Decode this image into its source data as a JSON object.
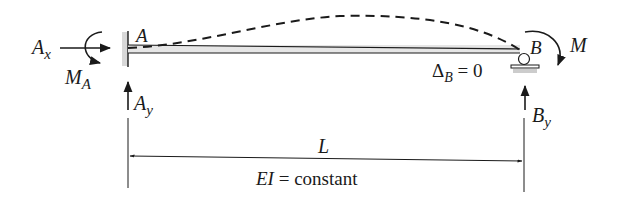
{
  "diagram": {
    "type": "beam-free-body",
    "labels": {
      "point_a": "A",
      "point_b": "B",
      "ax": "A",
      "ax_sub": "x",
      "ma": "M",
      "ma_sub": "A",
      "ay": "A",
      "ay_sub": "y",
      "by": "B",
      "by_sub": "y",
      "moment_b": "M",
      "delta_b": "Δ",
      "delta_b_sub": "B",
      "delta_b_value": " = 0",
      "length": "L",
      "ei": "EI",
      "ei_value": " = constant"
    },
    "supports": {
      "left": "fixed",
      "right": "roller"
    },
    "deflected_shape": "dashed",
    "colors": {
      "ink": "#1a1a1a",
      "beam_fill": "#e6e6e6",
      "support_fill": "#cccccc"
    }
  }
}
